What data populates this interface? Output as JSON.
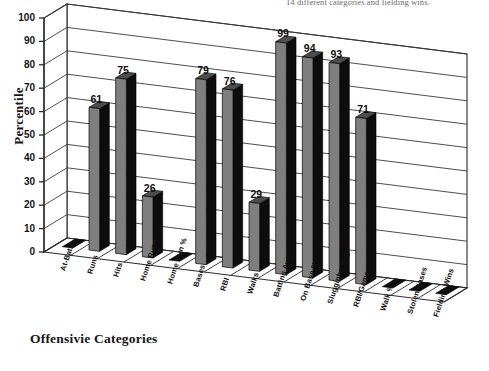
{
  "caption": {
    "text": "14 different categories and fielding wins."
  },
  "chart_data": {
    "type": "bar",
    "title": "",
    "xlabel": "Offensivie Categories",
    "ylabel": "Percentile",
    "ylim": [
      0,
      100
    ],
    "ytick_values": [
      0,
      10,
      20,
      30,
      40,
      50,
      60,
      70,
      80,
      90,
      100
    ],
    "grid": true,
    "legend": "none",
    "style": "3d-column",
    "categories": [
      "At-Bats",
      "Runs",
      "Hits",
      "Home Runs",
      "Home Run %",
      "Bases",
      "RBI",
      "Walks",
      "Batting Avg.",
      "On Base %",
      "Slugginhg Avg.",
      "RBI/Game",
      "Walk %",
      "Stolen Bases",
      "Fielding Wins"
    ],
    "values": [
      0,
      61,
      75,
      26,
      0,
      79,
      76,
      29,
      99,
      94,
      93,
      71,
      0,
      0,
      0
    ],
    "data_labels": [
      "",
      "61",
      "75",
      "26",
      "",
      "79",
      "76",
      "29",
      "99",
      "94",
      "93",
      "71",
      "",
      "",
      ""
    ],
    "colors": {
      "bar_face": "#7f7f7f",
      "bar_side": "#0d0d0d",
      "bar_top": "#4d4d4d",
      "axis": "#2b2b2b",
      "grid": "#3a3a3a",
      "text": "#121212",
      "background": "#ffffff"
    }
  }
}
